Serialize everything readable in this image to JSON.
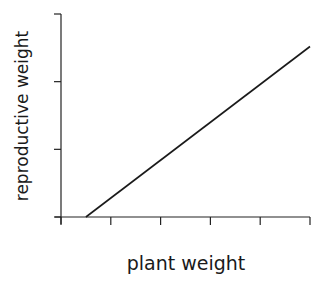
{
  "chart_data": {
    "type": "line",
    "title": "",
    "xlabel": "plant weight",
    "ylabel": "reproductive weight",
    "x_ticks": 6,
    "y_ticks": 4,
    "tick_labels_shown": false,
    "xlim": [
      0,
      5
    ],
    "ylim": [
      0,
      3
    ],
    "grid": false,
    "legend": null,
    "series": [
      {
        "name": "reproductive vs plant weight",
        "x": [
          0.5,
          5.0
        ],
        "y": [
          0.0,
          2.52
        ]
      }
    ],
    "annotations": []
  },
  "colors": {
    "line": "#1a1a1a",
    "axis": "#222222",
    "background": "#ffffff"
  }
}
